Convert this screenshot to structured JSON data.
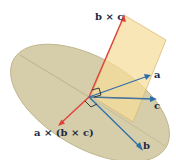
{
  "figure": {
    "type": "vector-triple-product-diagram",
    "labels": {
      "b_cross_c": "b × c",
      "a": "a",
      "c": "c",
      "b": "b",
      "a_cross_b_cross_c": "a × (b × c)"
    },
    "colors": {
      "background": "#ffffff",
      "disk_fill": "#d6ceaa",
      "disk_edge": "#b9ae84",
      "plane_fill": "#f5dc9a",
      "plane_edge": "#d9b46a",
      "red_vector": "#e0413a",
      "blue_vector": "#2f6fa8",
      "right_angle_marker": "#1b2a3a",
      "label_text": "#1f2a44"
    },
    "vectors": [
      {
        "name": "b × c",
        "color": "red",
        "direction": "up, perpendicular to plane of b and c"
      },
      {
        "name": "a × (b × c)",
        "color": "red",
        "direction": "down-left, in plane of b and c"
      },
      {
        "name": "a",
        "color": "blue"
      },
      {
        "name": "b",
        "color": "blue"
      },
      {
        "name": "c",
        "color": "blue"
      }
    ]
  }
}
